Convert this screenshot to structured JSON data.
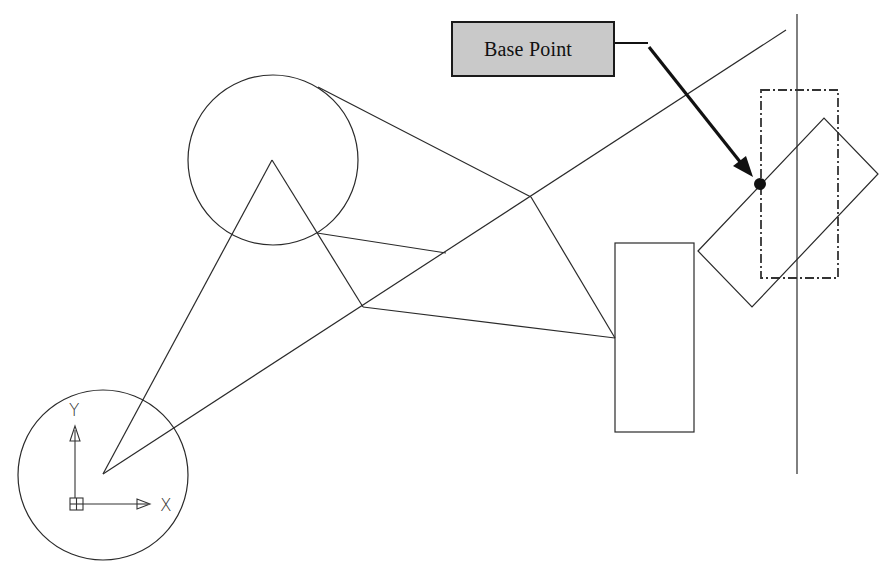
{
  "diagram": {
    "callout": {
      "label": "Base Point",
      "box_color": "#c9c9c9",
      "border_color": "#1a1a1a"
    },
    "ucs_icon": {
      "x_label": "X",
      "y_label": "Y"
    },
    "colors": {
      "line": "#2a2a2a",
      "dashed_outline": "#333333",
      "base_point_marker": "#111111",
      "background": "#ffffff"
    },
    "elements": {
      "circles": [
        {
          "name": "upper-circle",
          "cx": 273,
          "cy": 160,
          "r": 85
        },
        {
          "name": "lower-circle",
          "cx": 103,
          "cy": 475,
          "r": 85
        }
      ],
      "upright_rectangle": {
        "x": 615,
        "y": 243,
        "width": 79,
        "height": 189
      },
      "dashed_rectangle": {
        "x": 761,
        "y": 90,
        "width": 77,
        "height": 188
      },
      "rotated_rectangle": [
        [
          698,
          251
        ],
        [
          824,
          118
        ],
        [
          878,
          174
        ],
        [
          752,
          307
        ]
      ],
      "vertical_line": {
        "x": 797,
        "y1": 14,
        "y2": 474
      },
      "base_point": {
        "x": 760,
        "y": 184
      }
    }
  }
}
